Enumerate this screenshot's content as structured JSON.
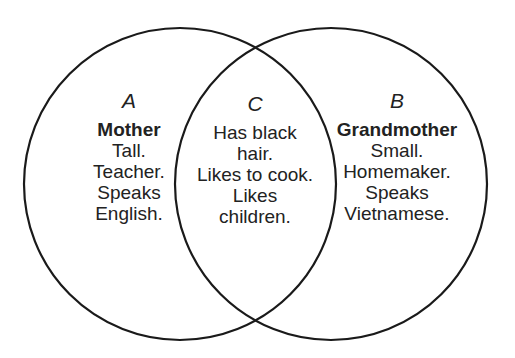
{
  "diagram": {
    "type": "venn",
    "stroke_color": "#1a1a1a",
    "background": "#ffffff",
    "circles": [
      {
        "id": "A",
        "cx": 180,
        "cy": 184,
        "r": 156
      },
      {
        "id": "B",
        "cx": 330,
        "cy": 184,
        "r": 156
      }
    ],
    "regions": {
      "a": {
        "letter": "A",
        "title": "Mother",
        "lines": [
          "Tall.",
          "Teacher.",
          "Speaks",
          "English."
        ]
      },
      "c": {
        "letter": "C",
        "lines": [
          "Has black",
          "hair.",
          "Likes to cook.",
          "Likes",
          "children."
        ]
      },
      "b": {
        "letter": "B",
        "title": "Grandmother",
        "lines": [
          "Small.",
          "Homemaker.",
          "Speaks",
          "Vietnamese."
        ]
      }
    }
  }
}
